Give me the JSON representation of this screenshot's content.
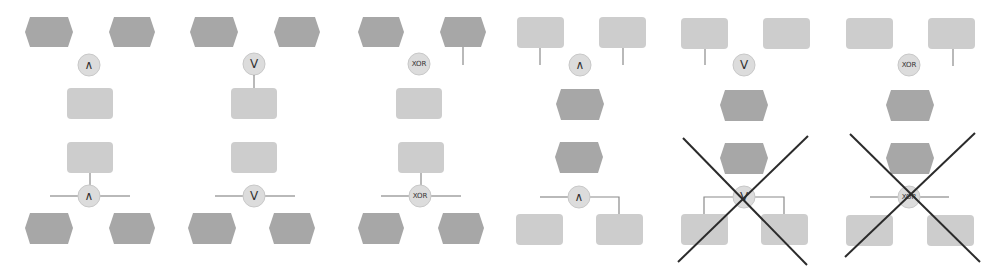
{
  "colors": {
    "event_hexagon": "#a7a7a7",
    "function_rect": "#cdcdcd",
    "operator_circle": "#dcdcdc",
    "connector_line": "#8a8a8a",
    "invalid_cross": "#2b2b2b"
  },
  "panels": [
    {
      "top_operator": "∧",
      "bottom_operator": "∧",
      "top_kind": "events",
      "invalid": false
    },
    {
      "top_operator": "V",
      "bottom_operator": "V",
      "top_kind": "events",
      "invalid": false
    },
    {
      "top_operator": "XOR",
      "bottom_operator": "XOR",
      "top_kind": "events",
      "invalid": false
    },
    {
      "top_operator": "∧",
      "bottom_operator": "∧",
      "top_kind": "functions",
      "invalid": false
    },
    {
      "top_operator": "V",
      "bottom_operator": "V",
      "top_kind": "functions",
      "invalid": true
    },
    {
      "top_operator": "XOR",
      "bottom_operator": "XOR",
      "top_kind": "functions",
      "invalid": true
    }
  ]
}
